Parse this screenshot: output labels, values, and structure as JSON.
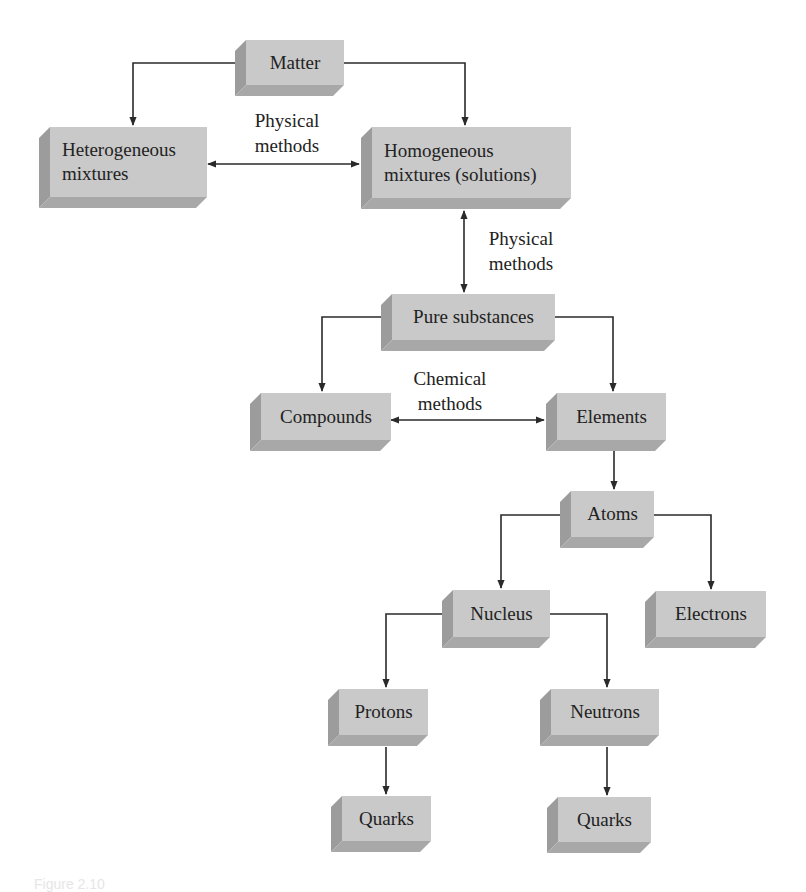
{
  "diagram": {
    "nodes": [
      {
        "id": "matter",
        "label": "Matter"
      },
      {
        "id": "heterogeneous",
        "label": "Heterogeneous\nmixtures"
      },
      {
        "id": "homogeneous",
        "label": "Homogeneous\nmixtures (solutions)"
      },
      {
        "id": "pure",
        "label": "Pure substances"
      },
      {
        "id": "compounds",
        "label": "Compounds"
      },
      {
        "id": "elements",
        "label": "Elements"
      },
      {
        "id": "atoms",
        "label": "Atoms"
      },
      {
        "id": "nucleus",
        "label": "Nucleus"
      },
      {
        "id": "electrons",
        "label": "Electrons"
      },
      {
        "id": "protons",
        "label": "Protons"
      },
      {
        "id": "neutrons",
        "label": "Neutrons"
      },
      {
        "id": "quarks1",
        "label": "Quarks"
      },
      {
        "id": "quarks2",
        "label": "Quarks"
      }
    ],
    "edges": [
      {
        "from": "matter",
        "to": "heterogeneous",
        "type": "arrow"
      },
      {
        "from": "matter",
        "to": "homogeneous",
        "type": "arrow"
      },
      {
        "from": "heterogeneous",
        "to": "homogeneous",
        "type": "double-arrow",
        "label": "Physical\nmethods"
      },
      {
        "from": "homogeneous",
        "to": "pure",
        "type": "double-arrow",
        "label": "Physical\nmethods"
      },
      {
        "from": "pure",
        "to": "compounds",
        "type": "arrow"
      },
      {
        "from": "pure",
        "to": "elements",
        "type": "arrow"
      },
      {
        "from": "compounds",
        "to": "elements",
        "type": "double-arrow",
        "label": "Chemical\nmethods"
      },
      {
        "from": "elements",
        "to": "atoms",
        "type": "arrow"
      },
      {
        "from": "atoms",
        "to": "nucleus",
        "type": "arrow"
      },
      {
        "from": "atoms",
        "to": "electrons",
        "type": "arrow"
      },
      {
        "from": "nucleus",
        "to": "protons",
        "type": "arrow"
      },
      {
        "from": "nucleus",
        "to": "neutrons",
        "type": "arrow"
      },
      {
        "from": "protons",
        "to": "quarks1",
        "type": "arrow"
      },
      {
        "from": "neutrons",
        "to": "quarks2",
        "type": "arrow"
      }
    ],
    "caption_fragment": "Figure 2.10"
  },
  "colors": {
    "face": "#c9c9c9",
    "side": "#9c9c9c",
    "bottom": "#a8a8a8",
    "line": "#2a2a2a"
  }
}
